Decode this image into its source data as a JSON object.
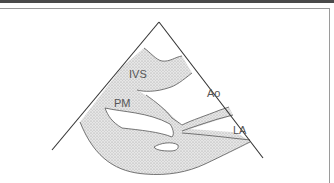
{
  "diagram": {
    "type": "echocardiogram-sector-schematic",
    "view": "parasternal long axis",
    "labels": [
      {
        "id": "ivs",
        "text": "IVS"
      },
      {
        "id": "pm",
        "text": "PM"
      },
      {
        "id": "ao",
        "text": "Ao"
      },
      {
        "id": "la",
        "text": "LA"
      }
    ],
    "colors": {
      "line": "#333333",
      "tissue_fill": "#dcdcdc",
      "frame": "#9a9a9a",
      "topbar": "#4a4a4a"
    }
  }
}
